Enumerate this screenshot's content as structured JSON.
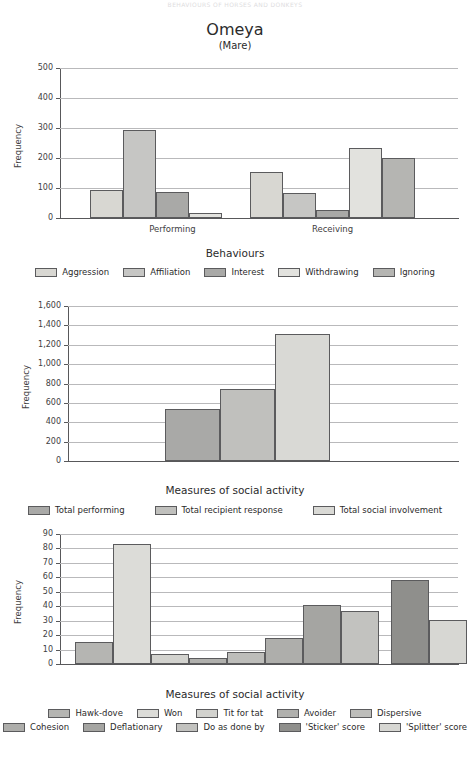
{
  "running_head": "BEHAVIOURS OF HORSES AND DONKEYS",
  "title": {
    "main": "Omeya",
    "sub": "(Mare)"
  },
  "palette": {
    "aggression": "#d8d7d2",
    "affiliation": "#c6c6c4",
    "interest": "#a9a9a7",
    "withdrawing": "#e2e2de",
    "ignoring": "#b5b5b2",
    "total_performing": "#a9a9a7",
    "total_recipient_response": "#c0c0bd",
    "total_social_involvement": "#d9d9d5",
    "hawk_dove": "#b5b5b2",
    "won": "#dcdcd8",
    "tit_for_tat": "#d2d2ce",
    "avoider": "#b0b0ad",
    "dispersive": "#bdbdba",
    "cohesion": "#aeaeab",
    "deflationary": "#a5a5a2",
    "do_as_done_by": "#c2c2bf",
    "sticker_score": "#8f8f8c",
    "splitter_score": "#d7d7d3",
    "axis": "#58585a",
    "grid": "#b9b9bb"
  },
  "charts": [
    {
      "id": "behaviours-chart",
      "chart_data": {
        "type": "bar",
        "title": "Omeya (Mare)",
        "xlabel": "Behaviours",
        "ylabel": "Frequency",
        "ylim": [
          0,
          500
        ],
        "yticks": [
          "0",
          "100",
          "200",
          "300",
          "400",
          "500"
        ],
        "ytick_values": [
          0,
          100,
          200,
          300,
          400,
          500
        ],
        "grid": true,
        "legend_position": "bottom",
        "categories": [
          "Performing",
          "Receiving"
        ],
        "series": [
          {
            "name": "Aggression",
            "values": [
              95,
              153
            ],
            "color_key": "aggression",
            "texture": "tx-diag"
          },
          {
            "name": "Affiliation",
            "values": [
              293,
              82
            ],
            "color_key": "affiliation",
            "texture": "tx-plain"
          },
          {
            "name": "Interest",
            "values": [
              88,
              26
            ],
            "color_key": "interest",
            "texture": "tx-plain"
          },
          {
            "name": "Withdrawing",
            "values": [
              18,
              234
            ],
            "color_key": "withdrawing",
            "texture": "tx-plain"
          },
          {
            "name": "Ignoring",
            "values": [
              0,
              201
            ],
            "color_key": "ignoring",
            "texture": "tx-plain"
          }
        ]
      }
    },
    {
      "id": "social-activity-totals-chart",
      "chart_data": {
        "type": "bar",
        "title": "",
        "xlabel": "Measures of social activity",
        "ylabel": "Frequency",
        "ylim": [
          0,
          1600
        ],
        "yticks": [
          "0",
          "200",
          "400",
          "600",
          "800",
          "1,000",
          "1,200",
          "1,400",
          "1,600"
        ],
        "ytick_values": [
          0,
          200,
          400,
          600,
          800,
          1000,
          1200,
          1400,
          1600
        ],
        "grid": true,
        "legend_position": "bottom",
        "categories": [
          "Total performing",
          "Total recipient response",
          "Total social involvement"
        ],
        "values": [
          535,
          745,
          1310
        ],
        "colors": [
          "total_performing",
          "total_recipient_response",
          "total_social_involvement"
        ],
        "textures": [
          "tx-diag",
          "tx-vert",
          "tx-plain"
        ]
      }
    },
    {
      "id": "social-strategy-chart",
      "chart_data": {
        "type": "bar",
        "title": "",
        "xlabel": "Measures of social activity",
        "ylabel": "Frequency",
        "ylim": [
          0,
          90
        ],
        "yticks": [
          "0",
          "10",
          "20",
          "30",
          "40",
          "50",
          "60",
          "70",
          "80",
          "90"
        ],
        "ytick_values": [
          0,
          10,
          20,
          30,
          40,
          50,
          60,
          70,
          80,
          90
        ],
        "grid": true,
        "legend_position": "bottom",
        "categories": [
          "Hawk-dove",
          "Won",
          "Tit for tat",
          "Avoider",
          "Dispersive",
          "Cohesion",
          "Deflationary",
          "Do as done by",
          "'Sticker' score",
          "'Splitter' score"
        ],
        "values": [
          15,
          83,
          7,
          4,
          8.5,
          18,
          41,
          37,
          58,
          30.5
        ],
        "colors": [
          "hawk_dove",
          "won",
          "tit_for_tat",
          "avoider",
          "dispersive",
          "cohesion",
          "deflationary",
          "do_as_done_by",
          "sticker_score",
          "splitter_score"
        ],
        "textures": [
          "tx-plain",
          "tx-plain",
          "tx-plain",
          "tx-plain",
          "tx-diag",
          "tx-plain",
          "tx-plain",
          "tx-diag",
          "tx-vert",
          "tx-diag"
        ]
      }
    }
  ],
  "legends": [
    {
      "id": "legend-behaviours",
      "rows": [
        [
          {
            "label": "Aggression",
            "color_key": "aggression",
            "texture": "tx-diag"
          },
          {
            "label": "Affiliation",
            "color_key": "affiliation",
            "texture": "tx-plain"
          },
          {
            "label": "Interest",
            "color_key": "interest",
            "texture": "tx-plain"
          },
          {
            "label": "Withdrawing",
            "color_key": "withdrawing",
            "texture": "tx-plain"
          },
          {
            "label": "Ignoring",
            "color_key": "ignoring",
            "texture": "tx-plain"
          }
        ]
      ]
    },
    {
      "id": "legend-social-totals",
      "rows": [
        [
          {
            "label": "Total performing",
            "color_key": "total_performing",
            "texture": "tx-diag"
          },
          {
            "label": "Total recipient response",
            "color_key": "total_recipient_response",
            "texture": "tx-vert"
          },
          {
            "label": "Total social involvement",
            "color_key": "total_social_involvement",
            "texture": "tx-plain"
          }
        ]
      ]
    },
    {
      "id": "legend-social-strategy",
      "rows": [
        [
          {
            "label": "Hawk-dove",
            "color_key": "hawk_dove",
            "texture": "tx-plain"
          },
          {
            "label": "Won",
            "color_key": "won",
            "texture": "tx-plain"
          },
          {
            "label": "Tit for tat",
            "color_key": "tit_for_tat",
            "texture": "tx-plain"
          },
          {
            "label": "Avoider",
            "color_key": "avoider",
            "texture": "tx-diag"
          },
          {
            "label": "Dispersive",
            "color_key": "dispersive",
            "texture": "tx-diag"
          }
        ],
        [
          {
            "label": "Cohesion",
            "color_key": "cohesion",
            "texture": "tx-plain"
          },
          {
            "label": "Deflationary",
            "color_key": "deflationary",
            "texture": "tx-plain"
          },
          {
            "label": "Do as done by",
            "color_key": "do_as_done_by",
            "texture": "tx-diag"
          },
          {
            "label": "'Sticker' score",
            "color_key": "sticker_score",
            "texture": "tx-vert"
          },
          {
            "label": "'Splitter' score",
            "color_key": "splitter_score",
            "texture": "tx-diag"
          }
        ]
      ]
    }
  ]
}
